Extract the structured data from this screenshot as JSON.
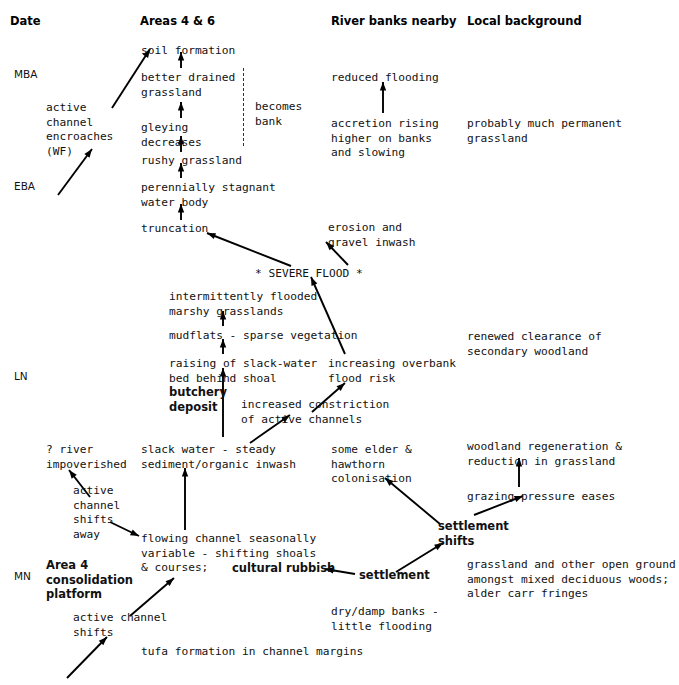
{
  "figure": {
    "type": "flow-diagram"
  },
  "columns": [
    {
      "id": "date",
      "label": "Date",
      "x": 10
    },
    {
      "id": "areas46",
      "label": "Areas 4 & 6",
      "x": 140
    },
    {
      "id": "banks",
      "label": "River banks nearby",
      "x": 331
    },
    {
      "id": "local",
      "label": "Local background",
      "x": 467
    }
  ],
  "era_labels": [
    {
      "id": "mba",
      "label": "MBA",
      "x": 14,
      "y": 68
    },
    {
      "id": "eba",
      "label": "EBA",
      "x": 14,
      "y": 180
    },
    {
      "id": "ln",
      "label": "LN",
      "x": 14,
      "y": 370
    },
    {
      "id": "mn",
      "label": "MN",
      "x": 14,
      "y": 570
    }
  ],
  "nodes": [
    {
      "id": "soil-formation",
      "text": "soil formation",
      "x": 141,
      "y": 44,
      "bold": false
    },
    {
      "id": "better-drained",
      "text": "better drained\ngrassland",
      "x": 141,
      "y": 71,
      "bold": false
    },
    {
      "id": "gleying-decreases",
      "text": "gleying\ndecreases",
      "x": 141,
      "y": 121,
      "bold": false
    },
    {
      "id": "rushy-grassland",
      "text": "rushy grassland",
      "x": 141,
      "y": 154,
      "bold": false
    },
    {
      "id": "perennially-stagnant",
      "text": "perennially stagnant\nwater body",
      "x": 141,
      "y": 181,
      "bold": false
    },
    {
      "id": "truncation",
      "text": "truncation",
      "x": 141,
      "y": 222,
      "bold": false
    },
    {
      "id": "active-channel-encroaches",
      "text": "active\nchannel\nencroaches\n(WF)",
      "x": 46,
      "y": 101,
      "bold": false
    },
    {
      "id": "becomes-bank",
      "text": "becomes\nbank",
      "x": 255,
      "y": 100,
      "bold": false
    },
    {
      "id": "reduced-flooding",
      "text": "reduced flooding",
      "x": 331,
      "y": 71,
      "bold": false
    },
    {
      "id": "accretion-rising",
      "text": "accretion rising\nhigher on banks\nand slowing",
      "x": 331,
      "y": 117,
      "bold": false
    },
    {
      "id": "probably-much-permanent",
      "text": "probably much permanent\ngrassland",
      "x": 467,
      "y": 117,
      "bold": false
    },
    {
      "id": "erosion-gravel-inwash",
      "text": "erosion and\ngravel inwash",
      "x": 328,
      "y": 221,
      "bold": false
    },
    {
      "id": "severe-flood",
      "text": "* SEVERE FLOOD *",
      "x": 255,
      "y": 267,
      "bold": false
    },
    {
      "id": "intermittently-flooded",
      "text": "intermittently flooded\nmarshy grasslands",
      "x": 169,
      "y": 290,
      "bold": false
    },
    {
      "id": "mudflats",
      "text": "mudflats - sparse vegetation",
      "x": 169,
      "y": 329,
      "bold": false
    },
    {
      "id": "raising-slack-water",
      "text": "raising of slack-water\nbed behind shoal",
      "x": 169,
      "y": 357,
      "bold": false
    },
    {
      "id": "butchery-deposit",
      "text": "butchery\ndeposit",
      "x": 169,
      "y": 385,
      "bold": true
    },
    {
      "id": "increasing-overbank",
      "text": "increasing overbank\nflood risk",
      "x": 328,
      "y": 357,
      "bold": false
    },
    {
      "id": "renewed-clearance",
      "text": "renewed clearance of\nsecondary woodland",
      "x": 467,
      "y": 330,
      "bold": false
    },
    {
      "id": "increased-constriction",
      "text": "increased constriction\nof active channels",
      "x": 241,
      "y": 398,
      "bold": false
    },
    {
      "id": "river-impoverished",
      "text": "? river\nimpoverished",
      "x": 46,
      "y": 443,
      "bold": false
    },
    {
      "id": "slack-water-steady",
      "text": "slack water - steady\nsediment/organic inwash",
      "x": 141,
      "y": 443,
      "bold": false
    },
    {
      "id": "some-elder-hawthorn",
      "text": "some elder &\nhawthorn\ncolonisation",
      "x": 331,
      "y": 443,
      "bold": false
    },
    {
      "id": "woodland-regeneration",
      "text": "woodland regeneration &\nreduction in grassland",
      "x": 467,
      "y": 440,
      "bold": false
    },
    {
      "id": "active-channel-shifts-away",
      "text": "active\nchannel\nshifts\naway",
      "x": 73,
      "y": 484,
      "bold": false
    },
    {
      "id": "grazing-pressure-eases",
      "text": "grazing pressure eases",
      "x": 467,
      "y": 490,
      "bold": false
    },
    {
      "id": "flowing-channel",
      "text": "flowing channel seasonally\nvariable - shifting shoals\n& courses; ",
      "x": 141,
      "y": 532,
      "bold": false
    },
    {
      "id": "cultural-rubbish",
      "text": "cultural rubbish",
      "x": 232,
      "y": 561,
      "bold": true
    },
    {
      "id": "settlement-shifts",
      "text": "settlement\nshifts",
      "x": 438,
      "y": 519,
      "bold": true
    },
    {
      "id": "area4-consolidation",
      "text": "Area 4\nconsolidation\nplatform",
      "x": 46,
      "y": 558,
      "bold": true
    },
    {
      "id": "settlement",
      "text": "settlement",
      "x": 359,
      "y": 568,
      "bold": true
    },
    {
      "id": "grassland-other-open",
      "text": "grassland and other open ground\namongst mixed deciduous woods;\nalder carr fringes",
      "x": 467,
      "y": 558,
      "bold": false
    },
    {
      "id": "dry-damp-banks",
      "text": "dry/damp banks -\nlittle flooding",
      "x": 331,
      "y": 605,
      "bold": false
    },
    {
      "id": "active-channel-shifts-low",
      "text": "active channel\nshifts",
      "x": 73,
      "y": 611,
      "bold": false
    },
    {
      "id": "tufa-formation",
      "text": "tufa formation in channel margins",
      "x": 141,
      "y": 645,
      "bold": false
    }
  ],
  "dashed_line": {
    "id": "becomes-bank-divider",
    "x": 243,
    "y": 68,
    "height": 78
  },
  "arrows": [
    {
      "id": "arrow-rushy-to-gleying",
      "x1": 181,
      "y1": 152,
      "x2": 181,
      "y2": 136
    },
    {
      "id": "arrow-gleying-to-betterdrained",
      "x1": 181,
      "y1": 118,
      "x2": 181,
      "y2": 102
    },
    {
      "id": "arrow-betterdrained-to-soil",
      "x1": 181,
      "y1": 68,
      "x2": 181,
      "y2": 52
    },
    {
      "id": "arrow-stagnant-to-rushy",
      "x1": 181,
      "y1": 178,
      "x2": 181,
      "y2": 163
    },
    {
      "id": "arrow-truncation-to-stagnant",
      "x1": 181,
      "y1": 220,
      "x2": 181,
      "y2": 204
    },
    {
      "id": "arrow-activechannel-to-soil",
      "x1": 112,
      "y1": 108,
      "x2": 150,
      "y2": 49
    },
    {
      "id": "arrow-eba-to-activechannel",
      "x1": 58,
      "y1": 195,
      "x2": 92,
      "y2": 149
    },
    {
      "id": "arrow-accretion-to-reducedflood",
      "x1": 383,
      "y1": 113,
      "x2": 383,
      "y2": 82
    },
    {
      "id": "arrow-flood-to-truncation",
      "x1": 291,
      "y1": 266,
      "x2": 207,
      "y2": 233
    },
    {
      "id": "arrow-flood-to-erosion",
      "x1": 348,
      "y1": 265,
      "x2": 326,
      "y2": 242
    },
    {
      "id": "arrow-overbank-to-flood",
      "x1": 345,
      "y1": 354,
      "x2": 311,
      "y2": 277
    },
    {
      "id": "arrow-mudflats-to-intermittent",
      "x1": 223,
      "y1": 326,
      "x2": 223,
      "y2": 311
    },
    {
      "id": "arrow-raising-to-mudflats",
      "x1": 223,
      "y1": 354,
      "x2": 223,
      "y2": 339
    },
    {
      "id": "arrow-slackwater-to-raising",
      "x1": 223,
      "y1": 437,
      "x2": 223,
      "y2": 368
    },
    {
      "id": "arrow-constriction-to-overbank",
      "x1": 312,
      "y1": 412,
      "x2": 345,
      "y2": 383
    },
    {
      "id": "arrow-slackwater-to-constriction",
      "x1": 250,
      "y1": 443,
      "x2": 290,
      "y2": 415
    },
    {
      "id": "arrow-shiftsaway-to-impoverished",
      "x1": 90,
      "y1": 497,
      "x2": 69,
      "y2": 470
    },
    {
      "id": "arrow-flowing-to-slackwater",
      "x1": 185,
      "y1": 530,
      "x2": 185,
      "y2": 468
    },
    {
      "id": "arrow-shiftsaway-to-flowing",
      "x1": 110,
      "y1": 522,
      "x2": 139,
      "y2": 536
    },
    {
      "id": "arrow-activeshifts-to-flowing",
      "x1": 130,
      "y1": 616,
      "x2": 174,
      "y2": 578
    },
    {
      "id": "arrow-lower-to-activeshifts",
      "x1": 67,
      "y1": 678,
      "x2": 107,
      "y2": 637
    },
    {
      "id": "arrow-settlement-to-cultural",
      "x1": 355,
      "y1": 574,
      "x2": 325,
      "y2": 569
    },
    {
      "id": "arrow-settlement-to-shifts",
      "x1": 396,
      "y1": 572,
      "x2": 443,
      "y2": 543
    },
    {
      "id": "arrow-shifts-to-elder",
      "x1": 440,
      "y1": 524,
      "x2": 385,
      "y2": 478
    },
    {
      "id": "arrow-shifts-to-grazing",
      "x1": 474,
      "y1": 515,
      "x2": 523,
      "y2": 496
    },
    {
      "id": "arrow-grazing-to-woodland",
      "x1": 519,
      "y1": 487,
      "x2": 519,
      "y2": 458
    }
  ]
}
